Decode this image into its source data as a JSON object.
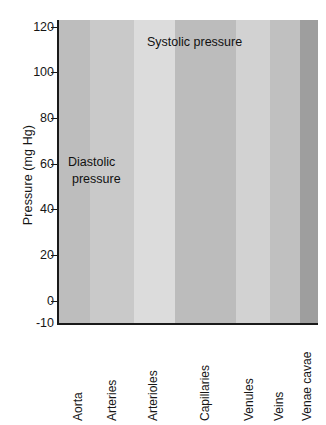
{
  "chart_data": {
    "type": "area",
    "title": "",
    "xlabel": "",
    "ylabel": "Pressure (mg Hg)",
    "ylim": [
      -10,
      125
    ],
    "yticks": [
      120,
      100,
      80,
      60,
      40,
      20,
      0,
      -10
    ],
    "ytick_labels": [
      "120",
      "100",
      "80",
      "60",
      "40",
      "20",
      "0",
      "-10"
    ],
    "grid": false,
    "legend_position": "inline-annotations",
    "categories": [
      "Aorta",
      "Arteries",
      "Arterioles",
      "Capillaries",
      "Venules",
      "Veins",
      "Venae cavae"
    ],
    "band_shades": [
      "#bdbdbd",
      "#c9c9c9",
      "#dcdcdc",
      "#bcbcbc",
      "#d2d2d2",
      "#c0c0c0",
      "#9e9e9e"
    ],
    "annotations": [
      {
        "text": "Systolic pressure",
        "x": 0.33,
        "y": 113
      },
      {
        "text": "Diastolic",
        "x": 0.055,
        "y": 62
      },
      {
        "text": "pressure",
        "x": 0.055,
        "y": 52
      }
    ],
    "series": [
      {
        "name": "Systolic pressure",
        "values": [
          120,
          120,
          119,
          117,
          113,
          106,
          95,
          78,
          55,
          38,
          27,
          22,
          19,
          16,
          13,
          10,
          7,
          5,
          3,
          2,
          1
        ],
        "x": [
          0.0,
          0.05,
          0.1,
          0.15,
          0.2,
          0.25,
          0.3,
          0.34,
          0.38,
          0.43,
          0.48,
          0.54,
          0.6,
          0.66,
          0.72,
          0.78,
          0.84,
          0.9,
          0.94,
          0.97,
          1.0
        ]
      },
      {
        "name": "Diastolic pressure",
        "values": [
          90,
          90,
          89,
          88,
          86,
          83,
          78,
          70,
          55,
          38,
          27,
          22,
          19,
          16,
          13,
          10,
          7,
          5,
          3,
          2,
          1
        ],
        "x": [
          0.0,
          0.05,
          0.1,
          0.15,
          0.2,
          0.25,
          0.3,
          0.34,
          0.38,
          0.43,
          0.48,
          0.54,
          0.6,
          0.66,
          0.72,
          0.78,
          0.84,
          0.9,
          0.94,
          0.97,
          1.0
        ]
      }
    ],
    "mean_pressure_note": "Pulse pressure oscillation shown as hatched band between systolic and diastolic curves"
  },
  "axis": {
    "y_title": "Pressure (mg Hg)"
  }
}
